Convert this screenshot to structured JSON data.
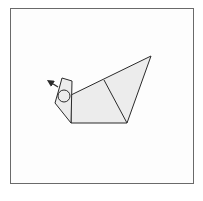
{
  "diagram": {
    "type": "origami-fold-step",
    "colors": {
      "paper_fill": "#ececec",
      "line": "#2a2a2a",
      "frame_border": "#6a6a6a",
      "background": "#fdfdfd"
    },
    "shapes": {
      "body": "71,95 151,56 127,123 71,123",
      "head": "62,78 72,81 71,123 55,103 59,89",
      "fold_line": [
        104,
        80,
        127,
        123
      ],
      "eye_circle": {
        "cx": 64,
        "cy": 96,
        "r": 6
      },
      "arrow": {
        "x1": 58,
        "y1": 87,
        "x2": 50,
        "y2": 82
      }
    }
  }
}
